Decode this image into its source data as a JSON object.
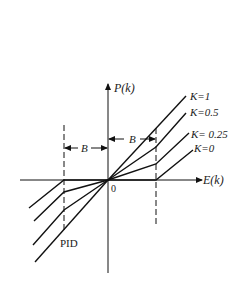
{
  "diagram": {
    "y_axis_label": "P(k)",
    "x_axis_label": "E(k)",
    "origin_label": "0",
    "band_label_left": "B",
    "band_label_right": "B",
    "pid_label": "PID",
    "curves": [
      {
        "label": "K=1",
        "gain": 1
      },
      {
        "label": "K=0.5",
        "gain": 0.5
      },
      {
        "label": "K= 0.25",
        "gain": 0.25
      },
      {
        "label": "K=0",
        "gain": 0
      }
    ],
    "line_color": "#111111"
  }
}
